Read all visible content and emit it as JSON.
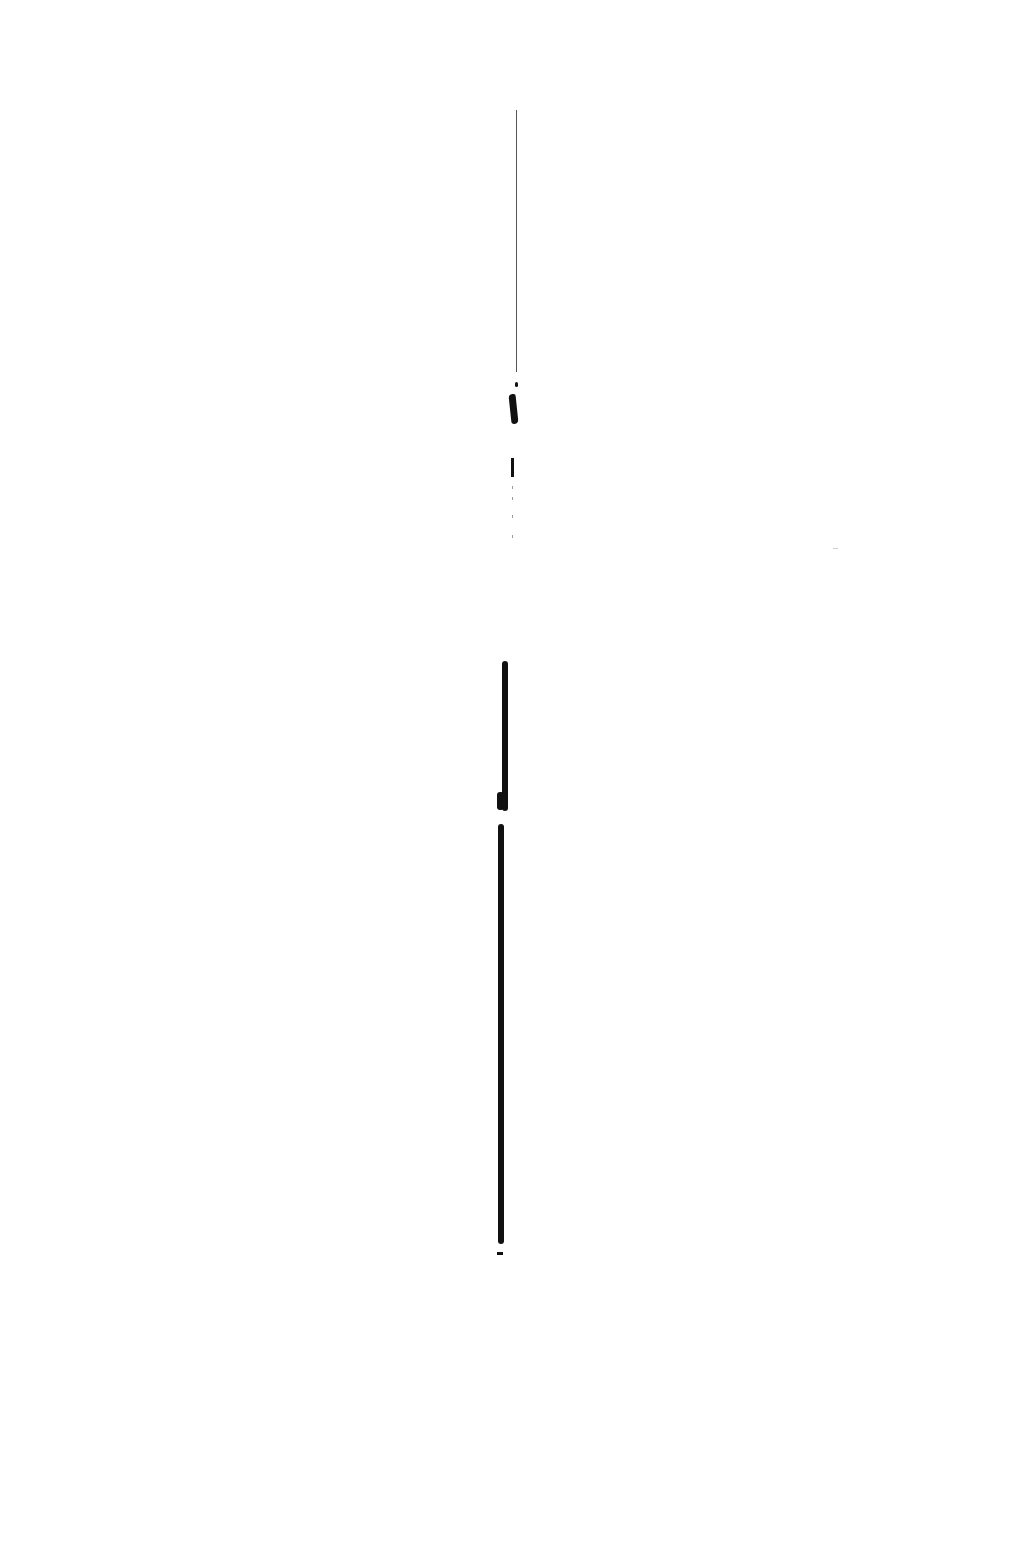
{
  "page": {
    "type": "scanned-page",
    "background_color": "#ffffff",
    "ink_color": "#111111",
    "visible_text": []
  }
}
